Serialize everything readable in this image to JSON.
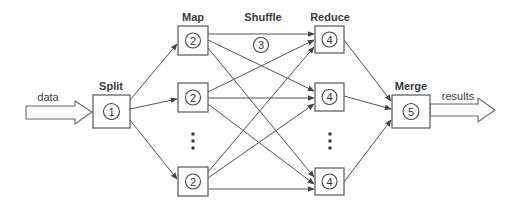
{
  "diagram": {
    "stages": {
      "split": "Split",
      "map": "Map",
      "shuffle": "Shuffle",
      "reduce": "Reduce",
      "merge": "Merge"
    },
    "io": {
      "input": "data",
      "output": "results"
    },
    "nodes": {
      "split": {
        "num": "1",
        "x": 93,
        "y": 95,
        "w": 37,
        "h": 33
      },
      "map": [
        {
          "num": "2",
          "x": 178,
          "y": 26,
          "w": 30,
          "h": 29
        },
        {
          "num": "2",
          "x": 178,
          "y": 83,
          "w": 30,
          "h": 29
        },
        {
          "num": "2",
          "x": 178,
          "y": 167,
          "w": 30,
          "h": 29
        }
      ],
      "shuffle_marker": {
        "num": "3",
        "cx": 261,
        "cy": 45
      },
      "reduce": [
        {
          "num": "4",
          "x": 315,
          "y": 26,
          "w": 29,
          "h": 27
        },
        {
          "num": "4",
          "x": 315,
          "y": 83,
          "w": 29,
          "h": 28
        },
        {
          "num": "4",
          "x": 315,
          "y": 168,
          "w": 29,
          "h": 27
        }
      ],
      "merge": {
        "num": "5",
        "x": 392,
        "y": 95,
        "w": 38,
        "h": 33
      }
    },
    "ellipsis": {
      "map_column": {
        "x": 193,
        "ys": [
          134,
          141,
          148
        ]
      },
      "reduce_column": {
        "x": 330,
        "ys": [
          134,
          141,
          148
        ]
      }
    },
    "colors": {
      "stroke": "#555555",
      "text": "#3a3a3a",
      "background": "#ffffff"
    }
  }
}
